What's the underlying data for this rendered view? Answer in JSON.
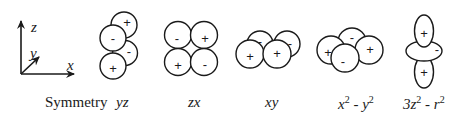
{
  "axes": {
    "z_label": "z",
    "y_label": "y",
    "x_label": "x"
  },
  "orbitals": [
    {
      "symmetry": "yz",
      "signs": [
        "+",
        "-",
        "-",
        "+"
      ]
    },
    {
      "symmetry": "zx",
      "signs": [
        "-",
        "+",
        "+",
        "-"
      ]
    },
    {
      "symmetry": "xy",
      "signs": [
        "-",
        "+",
        "+",
        "-"
      ]
    },
    {
      "symmetry": "x2 - y2",
      "signs": [
        "-",
        "+",
        "+",
        "-"
      ]
    },
    {
      "symmetry": "3z2 - r2",
      "signs": [
        "+",
        "-",
        "+"
      ]
    }
  ],
  "captions": {
    "row_label": "Symmetry",
    "yz": "yz",
    "zx": "zx",
    "xy": "xy",
    "x2y2_base1": "x",
    "x2y2_exp1": "2",
    "x2y2_mid": " - y",
    "x2y2_exp2": "2",
    "z2_base1": "3z",
    "z2_exp1": "2",
    "z2_mid": " - r",
    "z2_exp2": "2"
  }
}
